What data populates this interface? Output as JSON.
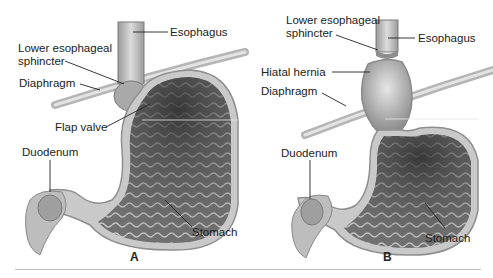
{
  "figure": {
    "panels": [
      {
        "id": "A",
        "letter": "A",
        "description": "Normal anatomy",
        "labels": {
          "esophagus": "Esophagus",
          "les_line1": "Lower esophageal",
          "les_line2": "sphincter",
          "diaphragm": "Diaphragm",
          "flap_valve": "Flap valve",
          "duodenum": "Duodenum",
          "stomach": "Stomach"
        }
      },
      {
        "id": "B",
        "letter": "B",
        "description": "Hiatal hernia",
        "labels": {
          "les_line1": "Lower esophageal",
          "les_line2": "sphincter",
          "esophagus": "Esophagus",
          "hiatal_hernia": "Hiatal hernia",
          "diaphragm": "Diaphragm",
          "duodenum": "Duodenum",
          "stomach": "Stomach"
        }
      }
    ],
    "colors": {
      "tissue_dark": "#4a4a4a",
      "tissue_mid": "#8a8a8a",
      "tissue_light": "#d6d6d6",
      "wall": "#b8b8b8",
      "rule": "#bdbdbd",
      "text": "#222222"
    }
  }
}
